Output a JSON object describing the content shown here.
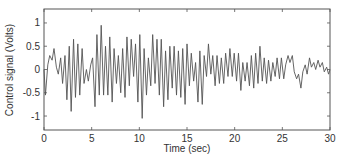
{
  "chart_data": {
    "type": "line",
    "title": "",
    "xlabel": "Time (sec)",
    "ylabel": "Control signal (Volts)",
    "xlim": [
      0,
      30
    ],
    "ylim": [
      -1.3,
      1.3
    ],
    "grid": false,
    "legend": null,
    "x_ticks": [
      0,
      5,
      10,
      15,
      20,
      25,
      30
    ],
    "x_tick_labels": [
      "0",
      "5",
      "10",
      "15",
      "20",
      "25",
      "30"
    ],
    "y_ticks": [
      1,
      0.5,
      0,
      -0.5,
      -1
    ],
    "y_tick_labels": [
      "1",
      "0.5",
      "0",
      "-0.5",
      "-1"
    ],
    "line_color": "#555555",
    "series": [
      {
        "name": "Control signal",
        "x": [
          0,
          0.15,
          0.4,
          0.6,
          0.85,
          1.05,
          1.3,
          1.5,
          1.75,
          1.95,
          2.2,
          2.4,
          2.65,
          2.85,
          3.1,
          3.3,
          3.55,
          3.75,
          4.0,
          4.2,
          4.45,
          4.65,
          4.9,
          5.1,
          5.35,
          5.55,
          5.8,
          6.0,
          6.25,
          6.45,
          6.7,
          6.9,
          7.15,
          7.35,
          7.6,
          7.8,
          8.05,
          8.25,
          8.5,
          8.7,
          8.95,
          9.15,
          9.4,
          9.6,
          9.85,
          10.05,
          10.3,
          10.5,
          10.75,
          10.95,
          11.2,
          11.4,
          11.65,
          11.85,
          12.1,
          12.3,
          12.55,
          12.75,
          13.0,
          13.2,
          13.45,
          13.65,
          13.9,
          14.1,
          14.35,
          14.55,
          14.8,
          15.0,
          15.25,
          15.45,
          15.7,
          15.9,
          16.15,
          16.35,
          16.6,
          16.8,
          17.05,
          17.25,
          17.5,
          17.7,
          17.95,
          18.15,
          18.4,
          18.6,
          18.85,
          19.05,
          19.3,
          19.5,
          19.75,
          19.95,
          20.2,
          20.4,
          20.65,
          20.85,
          21.1,
          21.3,
          21.55,
          21.75,
          22.0,
          22.2,
          22.45,
          22.65,
          22.9,
          23.1,
          23.35,
          23.55,
          23.8,
          24.0,
          24.25,
          24.45,
          24.7,
          24.9,
          25.15,
          25.35,
          25.6,
          25.8,
          26.05,
          26.25,
          26.5,
          26.7,
          26.95,
          27.15,
          27.4,
          27.6,
          27.85,
          28.05,
          28.3,
          28.5,
          28.75,
          28.95,
          29.2,
          29.4,
          29.65,
          29.85,
          30.0
        ],
        "y": [
          0.0,
          -0.55,
          0.1,
          0.3,
          0.2,
          0.45,
          0.05,
          -0.1,
          0.25,
          -0.3,
          0.3,
          -0.65,
          0.5,
          -0.9,
          0.65,
          -0.6,
          0.55,
          -0.55,
          0.45,
          -0.3,
          0.0,
          -0.25,
          0.1,
          0.25,
          -0.8,
          0.75,
          -0.55,
          0.95,
          -0.55,
          0.5,
          -0.55,
          0.7,
          -0.7,
          0.45,
          -0.3,
          0.3,
          -0.5,
          0.45,
          -0.6,
          0.7,
          -0.35,
          0.65,
          -0.15,
          0.55,
          -0.7,
          0.75,
          -1.05,
          0.45,
          -0.55,
          0.25,
          -0.35,
          0.75,
          -0.3,
          0.65,
          -0.55,
          0.65,
          -0.8,
          0.4,
          -0.65,
          0.5,
          -0.4,
          0.5,
          -0.55,
          0.4,
          -0.6,
          0.45,
          -0.75,
          0.55,
          -0.35,
          0.35,
          -0.25,
          0.15,
          -0.7,
          0.4,
          -0.75,
          0.3,
          -0.15,
          0.55,
          -0.1,
          0.3,
          -0.35,
          0.3,
          -0.3,
          0.25,
          -0.3,
          0.35,
          -0.15,
          0.45,
          -0.15,
          0.35,
          -0.25,
          0.35,
          -0.45,
          0.15,
          -0.25,
          0.15,
          -0.35,
          0.3,
          -0.4,
          0.35,
          -0.3,
          0.5,
          -0.25,
          0.25,
          -0.3,
          0.2,
          -0.25,
          0.15,
          -0.15,
          0.25,
          -0.2,
          0.25,
          -0.2,
          0.1,
          0.3,
          0.15,
          0.3,
          -0.05,
          -0.2,
          -0.1,
          -0.4,
          -0.05,
          0.1,
          -0.1,
          0.25,
          0.05,
          0.15,
          0.0,
          0.2,
          0.05,
          0.15,
          -0.05,
          0.05,
          -0.1,
          0.0
        ]
      }
    ]
  }
}
